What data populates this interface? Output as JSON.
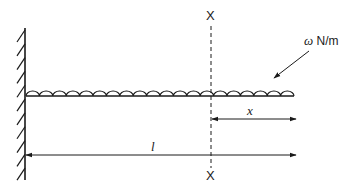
{
  "diagram": {
    "type": "cantilever-beam-udl",
    "colors": {
      "stroke": "#1a1a1a",
      "background": "#ffffff"
    },
    "wall": {
      "x": 25,
      "y_top": 28,
      "y_bottom": 180,
      "hatch_count": 11
    },
    "beam": {
      "x_start": 26,
      "x_end": 294,
      "y": 96
    },
    "load": {
      "arc_count": 20,
      "label_symbol": "ω",
      "label_unit": "N/m"
    },
    "section": {
      "label_top": "X",
      "label_bottom": "X",
      "x": 211
    },
    "dimensions": {
      "x_label": "x",
      "l_label": "l"
    }
  }
}
